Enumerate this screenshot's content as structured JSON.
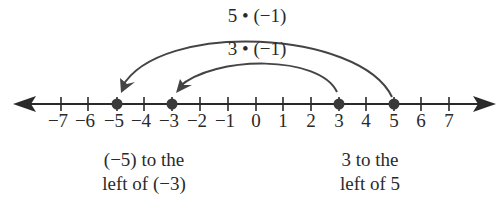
{
  "diagram": {
    "type": "number-line",
    "axis": {
      "min": -7,
      "max": 7,
      "ticks": [
        "−7",
        "−6",
        "−5",
        "−4",
        "−3",
        "−2",
        "−1",
        "0",
        "1",
        "2",
        "3",
        "4",
        "5",
        "6",
        "7"
      ],
      "arrows": "both"
    },
    "points": [
      {
        "value": -5,
        "label": "−5"
      },
      {
        "value": -3,
        "label": "−3"
      },
      {
        "value": 3,
        "label": "3"
      },
      {
        "value": 5,
        "label": "5"
      }
    ],
    "arcs": [
      {
        "from": 5,
        "to": -5,
        "label": "5 • (−1)"
      },
      {
        "from": 3,
        "to": -3,
        "label": "3 • (−1)"
      }
    ],
    "notes": [
      {
        "line1": "(−5) to the",
        "line2": "left of (−3)"
      },
      {
        "line1": "3 to the",
        "line2": "left of 5"
      }
    ],
    "colors": {
      "line": "#2a2a2a",
      "point": "#3a3a3a",
      "arc": "#444444"
    }
  }
}
